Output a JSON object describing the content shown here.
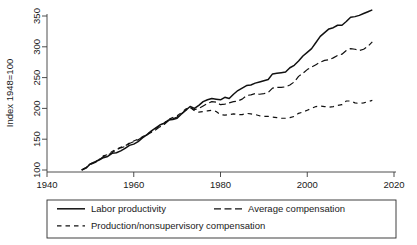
{
  "chart_data": {
    "type": "line",
    "title": "",
    "subtitle": "",
    "xlabel": "",
    "ylabel": "Index 1948=100",
    "xlim": [
      1940,
      2020
    ],
    "ylim": [
      100,
      350
    ],
    "xticks": [
      1940,
      1960,
      1980,
      2000,
      2020
    ],
    "yticks": [
      100,
      150,
      200,
      250,
      300,
      350
    ],
    "grid": false,
    "legend_position": "below-plot",
    "line_color": "#111111",
    "series": [
      {
        "name": "Labor productivity",
        "style": "solid",
        "x": [
          1948,
          1949,
          1950,
          1951,
          1952,
          1953,
          1954,
          1955,
          1956,
          1957,
          1958,
          1959,
          1960,
          1961,
          1962,
          1963,
          1964,
          1965,
          1966,
          1967,
          1968,
          1969,
          1970,
          1971,
          1972,
          1973,
          1974,
          1975,
          1976,
          1977,
          1978,
          1979,
          1980,
          1981,
          1982,
          1983,
          1984,
          1985,
          1986,
          1987,
          1988,
          1989,
          1990,
          1991,
          1992,
          1993,
          1994,
          1995,
          1996,
          1997,
          1998,
          1999,
          2000,
          2001,
          2002,
          2003,
          2004,
          2005,
          2006,
          2007,
          2008,
          2009,
          2010,
          2011,
          2012,
          2013,
          2014,
          2015
        ],
        "values": [
          100,
          103,
          110,
          113,
          116,
          120,
          122,
          127,
          128,
          131,
          135,
          140,
          142,
          146,
          152,
          157,
          163,
          168,
          173,
          176,
          181,
          182,
          184,
          191,
          197,
          203,
          200,
          205,
          211,
          214,
          216,
          215,
          214,
          218,
          216,
          223,
          229,
          233,
          237,
          238,
          241,
          243,
          245,
          247,
          256,
          257,
          258,
          259,
          266,
          270,
          277,
          285,
          291,
          297,
          307,
          317,
          323,
          329,
          331,
          335,
          335,
          341,
          348,
          349,
          351,
          354,
          357,
          360
        ],
        "values_note": "index 1948=100"
      },
      {
        "name": "Average compensation",
        "style": "dashed-long",
        "x": [
          1948,
          1949,
          1950,
          1951,
          1952,
          1953,
          1954,
          1955,
          1956,
          1957,
          1958,
          1959,
          1960,
          1961,
          1962,
          1963,
          1964,
          1965,
          1966,
          1967,
          1968,
          1969,
          1970,
          1971,
          1972,
          1973,
          1974,
          1975,
          1976,
          1977,
          1978,
          1979,
          1980,
          1981,
          1982,
          1983,
          1984,
          1985,
          1986,
          1987,
          1988,
          1989,
          1990,
          1991,
          1992,
          1993,
          1994,
          1995,
          1996,
          1997,
          1998,
          1999,
          2000,
          2001,
          2002,
          2003,
          2004,
          2005,
          2006,
          2007,
          2008,
          2009,
          2010,
          2011,
          2012,
          2013,
          2014,
          2015
        ],
        "values": [
          100,
          104,
          109,
          112,
          116,
          122,
          124,
          128,
          133,
          136,
          138,
          143,
          146,
          149,
          153,
          157,
          161,
          165,
          170,
          174,
          180,
          183,
          186,
          191,
          197,
          201,
          198,
          200,
          204,
          208,
          211,
          210,
          206,
          207,
          209,
          211,
          212,
          215,
          221,
          222,
          224,
          223,
          224,
          226,
          233,
          234,
          234,
          235,
          238,
          243,
          252,
          257,
          263,
          267,
          271,
          275,
          278,
          279,
          282,
          286,
          288,
          294,
          297,
          296,
          294,
          296,
          301,
          308
        ],
        "values_note": "index 1948=100"
      },
      {
        "name": "Production/nonsupervisory compensation",
        "style": "dashed-short",
        "x": [
          1948,
          1949,
          1950,
          1951,
          1952,
          1953,
          1954,
          1955,
          1956,
          1957,
          1958,
          1959,
          1960,
          1961,
          1962,
          1963,
          1964,
          1965,
          1966,
          1967,
          1968,
          1969,
          1970,
          1971,
          1972,
          1973,
          1974,
          1975,
          1976,
          1977,
          1978,
          1979,
          1980,
          1981,
          1982,
          1983,
          1984,
          1985,
          1986,
          1987,
          1988,
          1989,
          1990,
          1991,
          1992,
          1993,
          1994,
          1995,
          1996,
          1997,
          1998,
          1999,
          2000,
          2001,
          2002,
          2003,
          2004,
          2005,
          2006,
          2007,
          2008,
          2009,
          2010,
          2011,
          2012,
          2013,
          2014,
          2015
        ],
        "values": [
          100,
          104,
          110,
          113,
          117,
          123,
          125,
          130,
          134,
          137,
          139,
          144,
          147,
          150,
          154,
          158,
          162,
          167,
          172,
          176,
          182,
          185,
          188,
          193,
          199,
          202,
          196,
          194,
          195,
          196,
          197,
          195,
          190,
          189,
          190,
          191,
          190,
          190,
          192,
          191,
          190,
          188,
          187,
          187,
          186,
          185,
          184,
          184,
          185,
          187,
          192,
          194,
          197,
          200,
          203,
          204,
          203,
          202,
          203,
          205,
          206,
          212,
          212,
          209,
          208,
          209,
          211,
          213
        ],
        "values_note": "index 1948=100"
      }
    ]
  },
  "legend": {
    "items": [
      {
        "label": "Labor productivity",
        "style": "solid"
      },
      {
        "label": "Average compensation",
        "style": "dashed-long"
      },
      {
        "label": "Production/nonsupervisory compensation",
        "style": "dashed-short"
      }
    ]
  },
  "axes": {
    "y_title": "Index 1948=100",
    "x_tick_labels": [
      "1940",
      "1960",
      "1980",
      "2000",
      "2020"
    ],
    "y_tick_labels": [
      "100",
      "150",
      "200",
      "250",
      "300",
      "350"
    ]
  }
}
